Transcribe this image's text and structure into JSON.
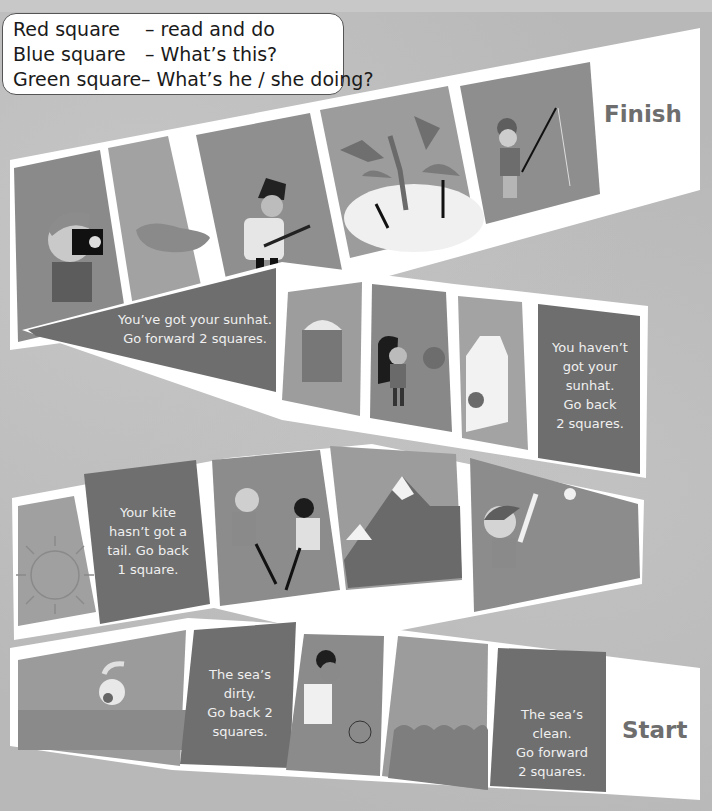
{
  "legend": {
    "rows": [
      {
        "key": "Red square",
        "value": "– read and do"
      },
      {
        "key": "Blue square",
        "value": "– What’s this?"
      },
      {
        "key": "Green square",
        "value": "– What’s he / she doing?"
      }
    ]
  },
  "board": {
    "finish_label": "Finish",
    "start_label": "Start",
    "colors": {
      "square_dark": "#6f6f6f",
      "square_mid": "#8d8d8d",
      "square_light": "#a4a4a4",
      "border": "#ffffff",
      "label_text": "#6e6e6e"
    },
    "row1": [
      {
        "type": "picture",
        "subject": "boy taking photo with camera"
      },
      {
        "type": "picture",
        "subject": "sausage"
      },
      {
        "type": "picture",
        "subject": "boy playing guitar"
      },
      {
        "type": "picture",
        "subject": "beach with palm trees and umbrellas"
      },
      {
        "type": "picture",
        "subject": "boy fishing"
      }
    ],
    "row2": [
      {
        "type": "text",
        "text": "You’ve got your sunhat.\nGo forward 2 squares."
      },
      {
        "type": "picture",
        "subject": "french fries"
      },
      {
        "type": "picture",
        "subject": "girl with balloon"
      },
      {
        "type": "picture",
        "subject": "juice carton with apple"
      },
      {
        "type": "text",
        "text": "You haven’t\ngot your\nsunhat.\nGo back\n2 squares."
      }
    ],
    "row3": [
      {
        "type": "picture",
        "subject": "sun"
      },
      {
        "type": "text",
        "text": "Your kite\nhasn’t got a\ntail. Go back\n1 square."
      },
      {
        "type": "picture",
        "subject": "children playing hockey"
      },
      {
        "type": "picture",
        "subject": "snowy mountains"
      },
      {
        "type": "picture",
        "subject": "boy playing baseball"
      }
    ],
    "row4": [
      {
        "type": "picture",
        "subject": "boy swimming"
      },
      {
        "type": "text",
        "text": "The sea’s\ndirty.\nGo back 2\nsquares."
      },
      {
        "type": "picture",
        "subject": "boy playing basketball"
      },
      {
        "type": "picture",
        "subject": "sea waves"
      },
      {
        "type": "text",
        "text": "The sea’s\nclean.\nGo forward\n2 squares."
      }
    ]
  }
}
